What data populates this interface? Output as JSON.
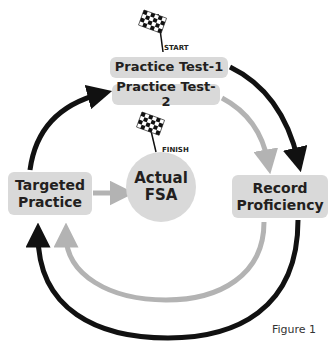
{
  "diagram": {
    "nodes": {
      "practice_test_1": "Practice Test-1",
      "practice_test_2": "Practice Test-2",
      "targeted_practice_line1": "Targeted",
      "targeted_practice_line2": "Practice",
      "actual_fsa_line1": "Actual",
      "actual_fsa_line2": "FSA",
      "record_proficiency_line1": "Record",
      "record_proficiency_line2": "Proficiency"
    },
    "flags": {
      "start_label": "START",
      "finish_label": "FINISH"
    },
    "edges": [
      {
        "from": "Practice Test-1",
        "to": "Record Proficiency",
        "color": "#111111"
      },
      {
        "from": "Record Proficiency",
        "to": "Targeted Practice",
        "color": "#111111",
        "path": "outer-loop"
      },
      {
        "from": "Targeted Practice",
        "to": "Practice Test-2",
        "color": "#111111"
      },
      {
        "from": "Practice Test-2",
        "to": "Record Proficiency",
        "color": "#b3b3b3"
      },
      {
        "from": "Record Proficiency",
        "to": "Targeted Practice",
        "color": "#b3b3b3",
        "path": "inner-loop"
      },
      {
        "from": "Targeted Practice",
        "to": "Actual FSA",
        "color": "#b3b3b3"
      }
    ],
    "colors": {
      "box_fill": "#d9d9d9",
      "black_arrow": "#111111",
      "gray_arrow": "#b3b3b3",
      "text": "#231f20"
    },
    "caption": "Figure 1"
  }
}
